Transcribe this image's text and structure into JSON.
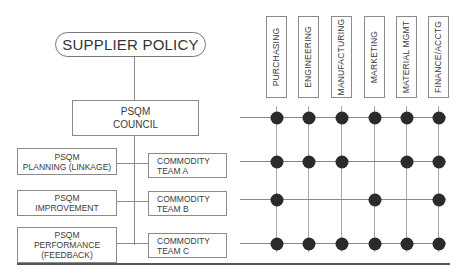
{
  "diagram": {
    "top_node": "SUPPLIER POLICY",
    "council": {
      "line1": "PSQM",
      "line2": "COUNCIL"
    },
    "left_boxes": [
      {
        "line1": "PSQM",
        "line2": "PLANNING (LINKAGE)",
        "line3": ""
      },
      {
        "line1": "PSQM",
        "line2": "IMPROVEMENT",
        "line3": ""
      },
      {
        "line1": "PSQM",
        "line2": "PERFORMANCE",
        "line3": "(FEEDBACK)"
      }
    ],
    "commodity_teams": [
      {
        "line1": "COMMODITY",
        "line2": "TEAM A"
      },
      {
        "line1": "COMMODITY",
        "line2": "TEAM B"
      },
      {
        "line1": "COMMODITY",
        "line2": "TEAM C"
      }
    ],
    "functions": [
      "PURCHASING",
      "ENGINEERING",
      "MANUFACTURING",
      "MARKETING",
      "MATERIAL MGMT",
      "FINANCE/ACCTG"
    ],
    "matrix_rows": [
      "PSQM COUNCIL",
      "COMMODITY TEAM A",
      "COMMODITY TEAM B",
      "COMMODITY TEAM C"
    ],
    "membership_matrix": [
      [
        1,
        1,
        1,
        1,
        1,
        1
      ],
      [
        1,
        1,
        1,
        0,
        1,
        1
      ],
      [
        1,
        0,
        0,
        1,
        0,
        1
      ],
      [
        1,
        1,
        1,
        1,
        1,
        1
      ]
    ],
    "colors": {
      "line": "#8a8a8a",
      "dot": "#2b2b2b",
      "rule": "#555555"
    }
  }
}
